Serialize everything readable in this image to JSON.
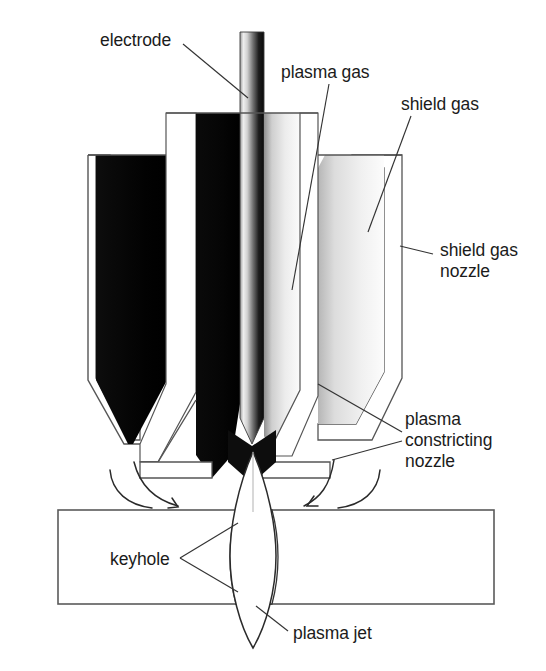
{
  "figure": {
    "background_color": "#ffffff",
    "width": 546,
    "height": 671
  },
  "labels": {
    "electrode": "electrode",
    "plasma_gas": "plasma gas",
    "shield_gas": "shield gas",
    "shield_gas_nozzle_line1": "shield gas",
    "shield_gas_nozzle_line2": "nozzle",
    "plasma_constricting_nozzle_line1": "plasma",
    "plasma_constricting_nozzle_line2": "constricting",
    "plasma_constricting_nozzle_line3": "nozzle",
    "keyhole": "keyhole",
    "plasma_jet": "plasma jet"
  },
  "colors": {
    "ink": "#1b1b1b",
    "leader": "#333333",
    "outline": "#555555",
    "dark_band": "#050505",
    "white_band": "#ffffff",
    "electrode_light": "#e8e8e8",
    "electrode_dark": "#121212",
    "shield_light": "#f2f2f2",
    "shield_mid": "#c9c9c9",
    "workpiece_fill": "#ffffff",
    "jet_fill": "#ffffff"
  },
  "parts": [
    {
      "name": "electrode",
      "description": "central cylindrical rod with pointed tip"
    },
    {
      "name": "plasma-gas-channel",
      "description": "annular passage around electrode"
    },
    {
      "name": "shield-gas-channel",
      "description": "outer annular passage"
    },
    {
      "name": "shield-gas-nozzle",
      "description": "outer tapered nozzle body"
    },
    {
      "name": "plasma-constricting-nozzle",
      "description": "inner tapered nozzle orifice"
    },
    {
      "name": "keyhole",
      "description": "through-thickness cavity in workpiece"
    },
    {
      "name": "plasma-jet",
      "description": "lens shaped jet through workpiece"
    },
    {
      "name": "workpiece",
      "description": "flat plate being welded"
    }
  ]
}
